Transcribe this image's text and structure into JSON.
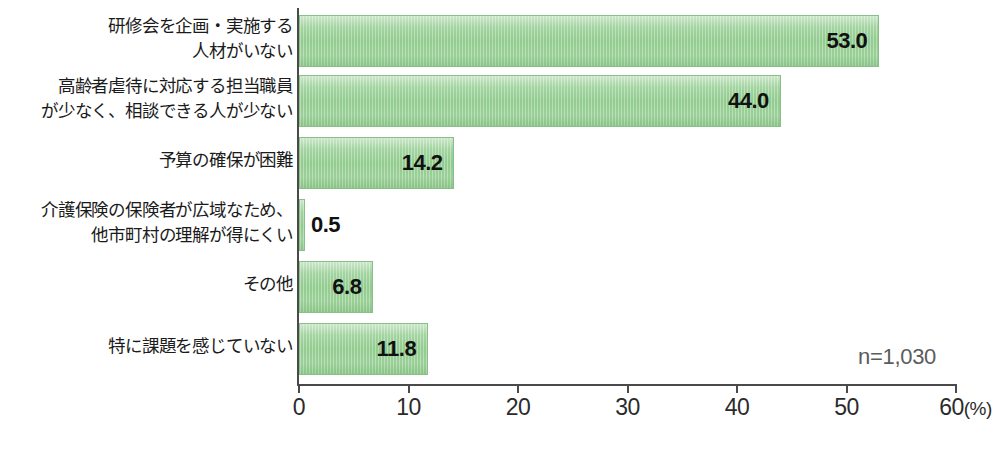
{
  "chart_data": {
    "type": "bar",
    "orientation": "horizontal",
    "title": "",
    "xlabel": "(%)",
    "ylabel": "",
    "xlim": [
      0,
      60
    ],
    "xticks": [
      0,
      10,
      20,
      30,
      40,
      50,
      60
    ],
    "xtick_labels": [
      "0",
      "10",
      "20",
      "30",
      "40",
      "50",
      "60"
    ],
    "unit_label": "(%)",
    "grid": false,
    "legend": "none",
    "sample_size_note": "n=1,030",
    "bar_color": "#8fcb8c",
    "bar_border_color": "#8bbf89",
    "axis_color": "#4a4a4a",
    "value_label_color": "#111111",
    "note_color": "#5c5c5c",
    "categories": [
      "研修会を企画・実施する\n人材がいない",
      "高齢者虐待に対応する担当職員\nが少なく、相談できる人が少ない",
      "予算の確保が困難",
      "介護保険の保険者が広域なため、\n他市町村の理解が得にくい",
      "その他",
      "特に課題を感じていない"
    ],
    "values": [
      53.0,
      44.0,
      14.2,
      0.5,
      6.8,
      11.8
    ],
    "value_labels": [
      "53.0",
      "44.0",
      "14.2",
      "0.5",
      "6.8",
      "11.8"
    ],
    "value_label_placement": [
      "inside",
      "inside",
      "inside",
      "outside",
      "inside",
      "inside"
    ]
  }
}
